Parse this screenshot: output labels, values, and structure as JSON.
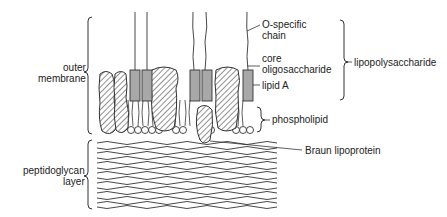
{
  "diagram": {
    "left_labels": {
      "outer_membrane": [
        "outer",
        "membrane"
      ],
      "peptidoglycan": [
        "peptidoglycan",
        "layer"
      ]
    },
    "right_labels": {
      "o_specific": [
        "O-specific",
        "chain"
      ],
      "core": [
        "core",
        "oligosaccharide"
      ],
      "lipid_a": "lipid A",
      "lipopolysaccharide": "lipopolysaccharide",
      "phospholipid": "phospholipid",
      "braun": "Braun lipoprotein"
    },
    "colors": {
      "line": "#333333",
      "lipid_a_fill": "#a8a8a8",
      "protein_hatch": "#555555"
    }
  }
}
